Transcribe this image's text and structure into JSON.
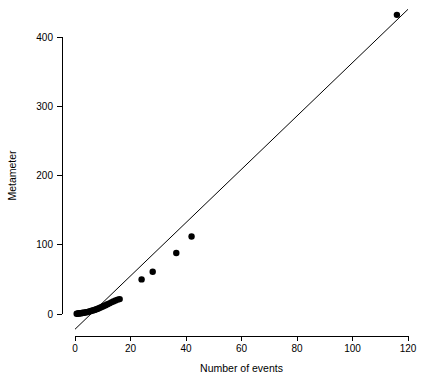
{
  "chart_data": {
    "type": "scatter",
    "title": "",
    "xlabel": "Number of events",
    "ylabel": "Metameter",
    "xlim": [
      -2,
      122
    ],
    "ylim": [
      -30,
      445
    ],
    "grid": false,
    "legend": "none",
    "xticks": [
      0,
      20,
      40,
      60,
      80,
      100,
      120
    ],
    "xtick_labels": [
      "0",
      "20",
      "40",
      "60",
      "80",
      "100",
      "120"
    ],
    "yticks": [
      0,
      100,
      200,
      300,
      400
    ],
    "ytick_labels": [
      "0",
      "100",
      "200",
      "300",
      "400"
    ],
    "series": [
      {
        "name": "observations",
        "marker": "filled-circle",
        "color": "#000000",
        "points": [
          [
            0.6,
            0.4
          ],
          [
            0.9,
            0.6
          ],
          [
            1.2,
            0.7
          ],
          [
            1.5,
            0.9
          ],
          [
            1.8,
            1.0
          ],
          [
            2.1,
            1.2
          ],
          [
            2.4,
            1.4
          ],
          [
            2.7,
            1.5
          ],
          [
            3.0,
            1.8
          ],
          [
            3.4,
            2.0
          ],
          [
            3.8,
            2.3
          ],
          [
            4.2,
            2.7
          ],
          [
            4.6,
            3.1
          ],
          [
            5.0,
            3.5
          ],
          [
            5.5,
            4.0
          ],
          [
            6.0,
            4.6
          ],
          [
            6.5,
            5.2
          ],
          [
            7.0,
            5.9
          ],
          [
            7.5,
            6.6
          ],
          [
            8.0,
            7.4
          ],
          [
            8.6,
            8.3
          ],
          [
            9.2,
            9.3
          ],
          [
            9.8,
            10.4
          ],
          [
            10.4,
            11.6
          ],
          [
            11.0,
            12.8
          ],
          [
            11.7,
            14.1
          ],
          [
            12.4,
            15.4
          ],
          [
            13.1,
            16.8
          ],
          [
            13.8,
            18.2
          ],
          [
            14.6,
            19.6
          ],
          [
            15.4,
            20.8
          ],
          [
            16.1,
            21.5
          ],
          [
            24.0,
            50.0
          ],
          [
            28.0,
            61.0
          ],
          [
            36.5,
            88.0
          ],
          [
            42.0,
            112.0
          ],
          [
            116.0,
            432.0
          ]
        ]
      }
    ],
    "fit_line": {
      "name": "fitted-line",
      "color": "#000000",
      "x_start": 0.0,
      "y_start": -22.0,
      "x_end": 120.0,
      "y_end": 440.0,
      "slope": 3.85,
      "intercept": -22.0
    }
  },
  "plot_geometry": {
    "x_pixel_min": 75,
    "x_pixel_max": 408,
    "y_pixel_min": 314,
    "y_pixel_max": 37,
    "point_radius": 3.2,
    "tick_length": 5
  }
}
